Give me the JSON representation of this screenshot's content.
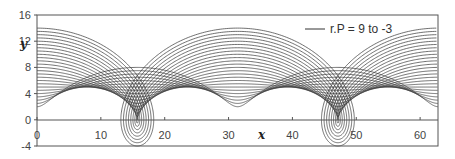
{
  "chart_data": {
    "type": "line",
    "title": "",
    "xlabel": "x",
    "ylabel": "y",
    "xlim": [
      0,
      62.8
    ],
    "ylim": [
      -4,
      16
    ],
    "x_ticks": [
      0,
      10,
      20,
      30,
      40,
      50,
      60
    ],
    "y_ticks": [
      -4,
      0,
      4,
      8,
      12,
      16
    ],
    "grid": false,
    "legend": {
      "position": "top-right",
      "entries": [
        "r.P = 9 to -3"
      ]
    },
    "series_description": "Family of trochoid curves x = R*t + d*sin(t), y = R + d*cos(t) with R = 5, t in [0, 4*pi], d from 9 to -3 in steps of 0.5",
    "series": {
      "R": 5,
      "d_start": 9,
      "d_end": -3,
      "d_step": 0.5,
      "t_max": 12.566
    },
    "line_color": "#333333"
  },
  "axes": {
    "x_label": "x",
    "y_label": "y"
  },
  "legend_label": "r.P = 9 to -3"
}
